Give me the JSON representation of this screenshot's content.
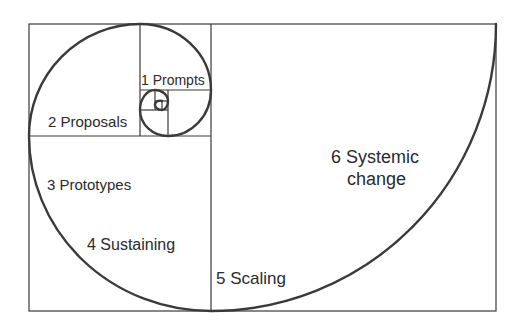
{
  "diagram": {
    "type": "golden-spiral",
    "colors": {
      "line": "#3a3a3a",
      "text": "#2b2b2b",
      "background": "#ffffff"
    },
    "stages": [
      {
        "number": "1",
        "label": "1 Prompts"
      },
      {
        "number": "2",
        "label": "2 Proposals"
      },
      {
        "number": "3",
        "label": "3 Prototypes"
      },
      {
        "number": "4",
        "label": "4 Sustaining"
      },
      {
        "number": "5",
        "label": "5 Scaling"
      },
      {
        "number": "6",
        "label_line1": "6 Systemic",
        "label_line2": "change"
      }
    ]
  }
}
